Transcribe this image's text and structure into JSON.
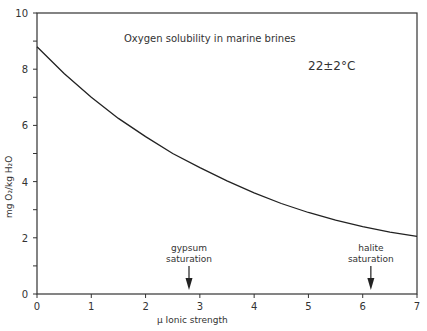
{
  "chart_data": {
    "type": "line",
    "title": "Oxygen solubility in marine brines",
    "annotation_temp": "22±2°C",
    "xlabel": "μ  Ionic strength",
    "ylabel": "mg O₂/kg H₂O",
    "xlim": [
      0,
      7
    ],
    "ylim": [
      0,
      10
    ],
    "x_ticks": [
      "0",
      "1",
      "2",
      "3",
      "4",
      "5",
      "6",
      "7"
    ],
    "y_ticks": [
      "0",
      "2",
      "4",
      "6",
      "8",
      "10"
    ],
    "grid": false,
    "series": [
      {
        "name": "O2 solubility",
        "x": [
          0,
          0.5,
          1,
          1.5,
          2,
          2.5,
          3,
          3.5,
          4,
          4.5,
          5,
          5.5,
          6,
          6.5,
          7
        ],
        "values": [
          8.8,
          7.85,
          7.0,
          6.25,
          5.6,
          5.0,
          4.5,
          4.03,
          3.6,
          3.22,
          2.9,
          2.63,
          2.4,
          2.2,
          2.05
        ]
      }
    ],
    "markers": [
      {
        "label_line1": "gypsum",
        "label_line2": "saturation",
        "x": 2.8
      },
      {
        "label_line1": "halite",
        "label_line2": "saturation",
        "x": 6.15
      }
    ]
  }
}
